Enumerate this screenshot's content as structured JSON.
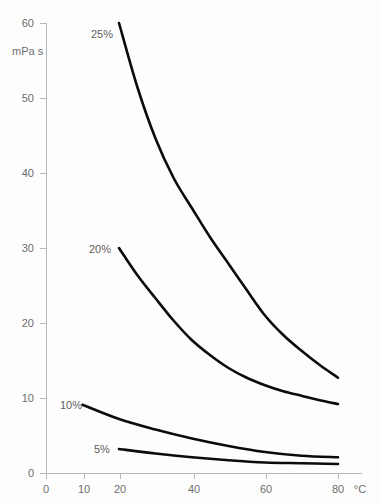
{
  "chart_data": {
    "type": "line",
    "title": "",
    "subtitle": "",
    "xlabel": "°C",
    "ylabel": "mPa s",
    "xlim": [
      0,
      80
    ],
    "ylim": [
      0,
      60
    ],
    "grid": false,
    "legend": "inline-curve-labels",
    "x_ticks": [
      0,
      10,
      20,
      40,
      60,
      80
    ],
    "x_tick_labels": [
      "0",
      "10",
      "20",
      "40",
      "60",
      "80"
    ],
    "y_ticks": [
      0,
      10,
      20,
      30,
      40,
      50,
      60
    ],
    "y_tick_labels": [
      "0",
      "10",
      "20",
      "30",
      "40",
      "50",
      "60"
    ],
    "series": [
      {
        "name": "25%",
        "label": "25%",
        "x": [
          20,
          25,
          30,
          35,
          40,
          45,
          50,
          55,
          60,
          65,
          70,
          75,
          80
        ],
        "values": [
          60.0,
          51.5,
          44.6,
          39.3,
          35.3,
          31.4,
          27.9,
          24.4,
          21.0,
          18.4,
          16.3,
          14.4,
          12.7
        ]
      },
      {
        "name": "20%",
        "label": "20%",
        "x": [
          20,
          25,
          30,
          35,
          40,
          45,
          50,
          55,
          60,
          65,
          70,
          75,
          80
        ],
        "values": [
          30.0,
          26.4,
          23.3,
          20.3,
          17.7,
          15.7,
          14.0,
          12.7,
          11.7,
          10.9,
          10.3,
          9.7,
          9.2
        ]
      },
      {
        "name": "10%",
        "label": "10%",
        "x": [
          10,
          20,
          30,
          40,
          50,
          60,
          70,
          80
        ],
        "values": [
          9.1,
          7.2,
          5.8,
          4.6,
          3.6,
          2.8,
          2.3,
          2.1
        ]
      },
      {
        "name": "5%",
        "label": "5%",
        "x": [
          20,
          30,
          40,
          50,
          60,
          70,
          80
        ],
        "values": [
          3.2,
          2.6,
          2.1,
          1.7,
          1.4,
          1.3,
          1.2
        ]
      }
    ],
    "annotations": [
      {
        "text": "25%",
        "x_px": 91,
        "y_px": 38
      },
      {
        "text": "20%",
        "x_px": 89,
        "y_px": 253
      },
      {
        "text": "10%",
        "x_px": 60,
        "y_px": 409
      },
      {
        "text": "5%",
        "x_px": 94,
        "y_px": 453
      }
    ],
    "colors": {
      "curve": "#0b0b0b",
      "axis": "#b9b9b9",
      "text": "#6d6d6d",
      "background": "#fdfdfd"
    }
  }
}
